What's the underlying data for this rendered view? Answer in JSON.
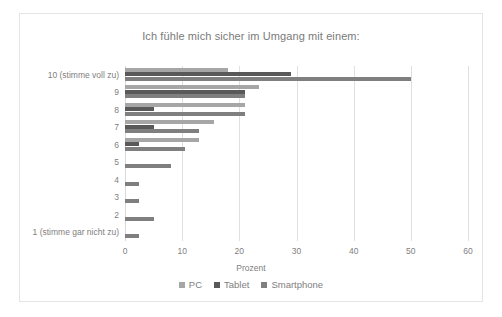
{
  "chart_data": {
    "type": "bar",
    "orientation": "horizontal",
    "title": "Ich fühle mich sicher im Umgang mit einem:",
    "xlabel": "Prozent",
    "ylabel": "",
    "xlim": [
      0,
      60
    ],
    "xticks": [
      0,
      10,
      20,
      30,
      40,
      50,
      60
    ],
    "grid": true,
    "legend_position": "bottom",
    "categories": [
      "10 (stimme voll zu)",
      "9",
      "8",
      "7",
      "6",
      "5",
      "4",
      "3",
      "2",
      "1 (stimme gar nicht zu)"
    ],
    "series": [
      {
        "name": "PC",
        "color": "#a6a6a6",
        "values": [
          18,
          23.5,
          21,
          15.5,
          13,
          0,
          0,
          0,
          0,
          0
        ]
      },
      {
        "name": "Tablet",
        "color": "#595959",
        "values": [
          29,
          21,
          5,
          5,
          2.5,
          0,
          0,
          0,
          0,
          0
        ]
      },
      {
        "name": "Smartphone",
        "color": "#7f7f7f",
        "values": [
          50,
          21,
          21,
          13,
          10.5,
          8,
          2.5,
          2.5,
          5,
          2.5
        ]
      }
    ]
  },
  "colors": {
    "frame_border": "#e4e4e4",
    "gridline": "#e0e0e0",
    "text": "#808080",
    "background": "#ffffff"
  }
}
